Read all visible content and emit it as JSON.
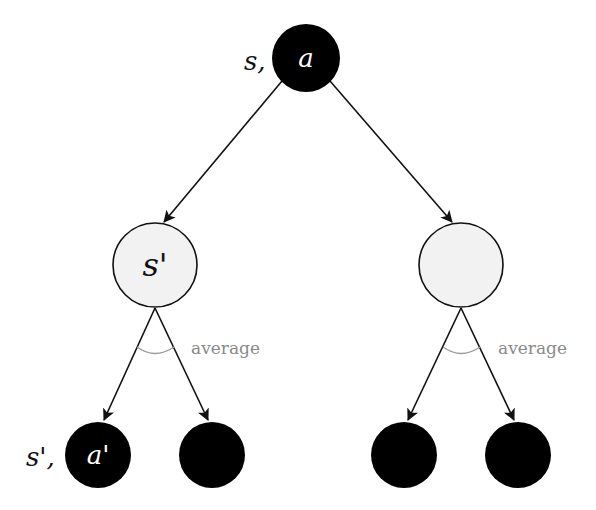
{
  "diagram": {
    "type": "tree",
    "colors": {
      "action_node_fill": "#000000",
      "state_node_fill": "#f2f2f2",
      "edge": "#111111",
      "annotation": "#8a8a8a"
    },
    "nodes": {
      "root": {
        "kind": "state-action",
        "inner_label": "a",
        "side_label": "s,"
      },
      "state_left": {
        "kind": "state",
        "inner_label": "s'"
      },
      "state_right": {
        "kind": "state",
        "inner_label": ""
      },
      "leaf_1": {
        "kind": "state-action",
        "inner_label": "a'",
        "side_label": "s',"
      },
      "leaf_2": {
        "kind": "state-action",
        "inner_label": ""
      },
      "leaf_3": {
        "kind": "state-action",
        "inner_label": ""
      },
      "leaf_4": {
        "kind": "state-action",
        "inner_label": ""
      }
    },
    "annotations": {
      "left_average": "average",
      "right_average": "average"
    }
  }
}
